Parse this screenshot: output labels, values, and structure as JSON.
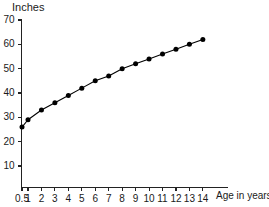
{
  "chart_data": {
    "type": "line",
    "title": "",
    "subtitle": "",
    "xlabel": "Age in years",
    "ylabel": "Inches",
    "grid": false,
    "legend": null,
    "legend_position": "none",
    "marker": "filled-circle",
    "line_color": "#000000",
    "marker_color": "#000000",
    "axis_color": "#222222",
    "background_color": "#ffffff",
    "xlim": [
      0.5,
      14
    ],
    "ylim": [
      0,
      70
    ],
    "xticks": [
      0.5,
      1,
      2,
      3,
      4,
      5,
      6,
      7,
      8,
      9,
      10,
      11,
      12,
      13,
      14
    ],
    "xtick_labels": [
      "0.5",
      "1",
      "2",
      "3",
      "4",
      "5",
      "6",
      "7",
      "8",
      "9",
      "10",
      "11",
      "12",
      "13",
      "14"
    ],
    "yticks": [
      10,
      20,
      30,
      40,
      50,
      60,
      70
    ],
    "ytick_labels": [
      "10",
      "20",
      "30",
      "40",
      "50",
      "60",
      "70"
    ],
    "x": [
      0.5,
      1,
      2,
      3,
      4,
      5,
      6,
      7,
      8,
      9,
      10,
      11,
      12,
      13,
      14
    ],
    "values": [
      26,
      29,
      33,
      36,
      39,
      42,
      45,
      47,
      50,
      52,
      54,
      56,
      58,
      60,
      62
    ],
    "points": [
      {
        "x": 0.5,
        "y": 26
      },
      {
        "x": 1,
        "y": 29
      },
      {
        "x": 2,
        "y": 33
      },
      {
        "x": 3,
        "y": 36
      },
      {
        "x": 4,
        "y": 39
      },
      {
        "x": 5,
        "y": 42
      },
      {
        "x": 6,
        "y": 45
      },
      {
        "x": 7,
        "y": 47
      },
      {
        "x": 8,
        "y": 50
      },
      {
        "x": 9,
        "y": 52
      },
      {
        "x": 10,
        "y": 54
      },
      {
        "x": 11,
        "y": 56
      },
      {
        "x": 12,
        "y": 58
      },
      {
        "x": 13,
        "y": 60
      },
      {
        "x": 14,
        "y": 62
      }
    ]
  }
}
